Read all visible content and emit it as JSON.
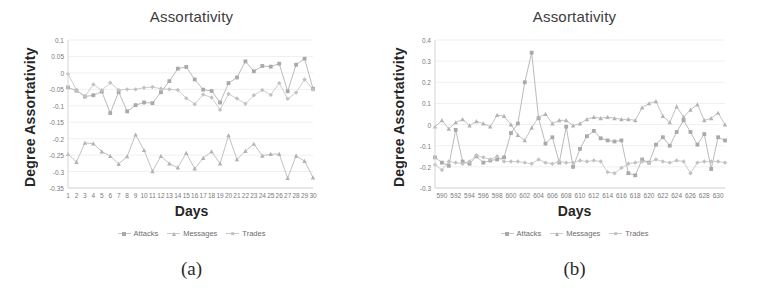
{
  "figure": {
    "panels": [
      {
        "caption": "(a)",
        "title": "Assortativity",
        "xlabel": "Days",
        "ylabel": "Degree Assortativity",
        "legend": [
          {
            "label": "Attacks",
            "marker": "square",
            "color": "#a9a9a9"
          },
          {
            "label": "Messages",
            "marker": "triangle",
            "color": "#b3b3b3"
          },
          {
            "label": "Trades",
            "marker": "diamond",
            "color": "#c2c2c2"
          }
        ]
      },
      {
        "caption": "(b)",
        "title": "Assortativity",
        "xlabel": "Days",
        "ylabel": "Degree Assortativity",
        "legend": [
          {
            "label": "Attacks",
            "marker": "square",
            "color": "#a9a9a9"
          },
          {
            "label": "Messages",
            "marker": "triangle",
            "color": "#b3b3b3"
          },
          {
            "label": "Trades",
            "marker": "diamond",
            "color": "#c2c2c2"
          }
        ]
      }
    ]
  },
  "chart_data": [
    {
      "type": "line",
      "panel": "(a)",
      "title": "Assortativity",
      "xlabel": "Days",
      "ylabel": "Degree Assortativity",
      "grid": true,
      "legend_position": "bottom",
      "xlim": [
        1,
        30
      ],
      "ylim": [
        -0.35,
        0.1
      ],
      "yticks": [
        0.1,
        0.05,
        0,
        -0.05,
        -0.1,
        -0.15,
        -0.2,
        -0.25,
        -0.3,
        -0.35
      ],
      "ytick_labels": [
        "0.1",
        "0.05",
        "0",
        "-0.05",
        "-0.1",
        "-0.15",
        "-0.2",
        "-0.25",
        "-0.3",
        "-0.35"
      ],
      "x": [
        1,
        2,
        3,
        4,
        5,
        6,
        7,
        8,
        9,
        10,
        11,
        12,
        13,
        14,
        15,
        16,
        17,
        18,
        19,
        20,
        21,
        22,
        23,
        24,
        25,
        26,
        27,
        28,
        29,
        30
      ],
      "xtick_labels": [
        "1",
        "2",
        "3",
        "4",
        "5",
        "6",
        "7",
        "8",
        "9",
        "10",
        "11",
        "12",
        "13",
        "14",
        "15",
        "16",
        "17",
        "18",
        "19",
        "20",
        "21",
        "22",
        "23",
        "24",
        "25",
        "26",
        "27",
        "28",
        "29",
        "30"
      ],
      "series": [
        {
          "name": "Attacks",
          "marker": "square",
          "color": "#a9a9a9",
          "values": [
            -0.044,
            -0.054,
            -0.072,
            -0.068,
            -0.057,
            -0.122,
            -0.058,
            -0.117,
            -0.098,
            -0.09,
            -0.092,
            -0.059,
            -0.025,
            0.013,
            0.018,
            -0.02,
            -0.051,
            -0.055,
            -0.09,
            -0.031,
            -0.014,
            0.035,
            0.005,
            0.021,
            0.019,
            0.028,
            -0.056,
            0.025,
            0.043,
            -0.048
          ]
        },
        {
          "name": "Messages",
          "marker": "triangle",
          "color": "#b3b3b3",
          "values": [
            -0.247,
            -0.271,
            -0.213,
            -0.215,
            -0.239,
            -0.253,
            -0.277,
            -0.254,
            -0.188,
            -0.235,
            -0.299,
            -0.253,
            -0.276,
            -0.288,
            -0.244,
            -0.291,
            -0.259,
            -0.239,
            -0.276,
            -0.19,
            -0.263,
            -0.238,
            -0.216,
            -0.252,
            -0.247,
            -0.247,
            -0.32,
            -0.252,
            -0.268,
            -0.318
          ]
        },
        {
          "name": "Trades",
          "marker": "diamond",
          "color": "#c2c2c2",
          "values": [
            -0.003,
            -0.052,
            -0.072,
            -0.035,
            -0.053,
            -0.03,
            -0.052,
            -0.05,
            -0.05,
            -0.045,
            -0.043,
            -0.048,
            -0.05,
            -0.052,
            -0.077,
            -0.095,
            -0.066,
            -0.075,
            -0.112,
            -0.064,
            -0.078,
            -0.094,
            -0.068,
            -0.052,
            -0.067,
            -0.031,
            -0.079,
            -0.06,
            -0.02,
            -0.051
          ]
        }
      ]
    },
    {
      "type": "line",
      "panel": "(b)",
      "title": "Assortativity",
      "xlabel": "Days",
      "ylabel": "Degree Assortativity",
      "grid": true,
      "legend_position": "bottom",
      "xlim": [
        589,
        631
      ],
      "ylim": [
        -0.3,
        0.4
      ],
      "yticks": [
        0.4,
        0.3,
        0.2,
        0.1,
        0,
        -0.1,
        -0.2,
        -0.3
      ],
      "ytick_labels": [
        "0.4",
        "0.3",
        "0.2",
        "0.1",
        "0",
        "-0.1",
        "-0.2",
        "-0.3"
      ],
      "x": [
        589,
        590,
        591,
        592,
        593,
        594,
        595,
        596,
        597,
        598,
        599,
        600,
        601,
        602,
        603,
        604,
        605,
        606,
        607,
        608,
        609,
        610,
        611,
        612,
        613,
        614,
        615,
        616,
        617,
        618,
        619,
        620,
        621,
        622,
        623,
        624,
        625,
        626,
        627,
        628,
        629,
        630,
        631
      ],
      "xtick_labels": [
        "590",
        "592",
        "594",
        "596",
        "598",
        "600",
        "602",
        "604",
        "606",
        "608",
        "610",
        "612",
        "614",
        "616",
        "618",
        "620",
        "622",
        "624",
        "626",
        "628",
        "630"
      ],
      "xtick_values": [
        590,
        592,
        594,
        596,
        598,
        600,
        602,
        604,
        606,
        608,
        610,
        612,
        614,
        616,
        618,
        620,
        622,
        624,
        626,
        628,
        630
      ],
      "series": [
        {
          "name": "Attacks",
          "marker": "square",
          "color": "#a9a9a9",
          "values": [
            -0.155,
            -0.18,
            -0.195,
            -0.025,
            -0.175,
            -0.185,
            -0.15,
            -0.18,
            -0.17,
            -0.165,
            -0.155,
            -0.04,
            0.005,
            0.2,
            0.34,
            0.03,
            -0.09,
            -0.06,
            -0.18,
            -0.01,
            -0.2,
            -0.115,
            -0.055,
            -0.03,
            -0.065,
            -0.075,
            -0.08,
            -0.075,
            -0.23,
            -0.24,
            -0.165,
            -0.18,
            -0.095,
            -0.06,
            -0.1,
            -0.035,
            0.02,
            -0.035,
            -0.095,
            -0.045,
            -0.21,
            -0.06,
            -0.075
          ]
        },
        {
          "name": "Messages",
          "marker": "triangle",
          "color": "#b3b3b3",
          "values": [
            -0.01,
            0.02,
            -0.02,
            0.01,
            0.025,
            -0.005,
            0.015,
            0.005,
            -0.01,
            0.045,
            0.04,
            0.0,
            -0.05,
            -0.075,
            -0.015,
            0.035,
            0.05,
            0.005,
            0.02,
            0.02,
            -0.005,
            0.005,
            0.025,
            0.035,
            0.03,
            0.035,
            0.03,
            0.025,
            0.025,
            0.02,
            0.08,
            0.1,
            0.11,
            0.04,
            0.01,
            0.085,
            0.035,
            0.07,
            0.095,
            0.02,
            0.03,
            0.055,
            0.0
          ]
        },
        {
          "name": "Trades",
          "marker": "diamond",
          "color": "#c2c2c2",
          "values": [
            -0.19,
            -0.215,
            -0.175,
            -0.18,
            -0.185,
            -0.175,
            -0.145,
            -0.155,
            -0.165,
            -0.15,
            -0.175,
            -0.175,
            -0.175,
            -0.18,
            -0.185,
            -0.165,
            -0.18,
            -0.185,
            -0.175,
            -0.18,
            -0.18,
            -0.17,
            -0.175,
            -0.17,
            -0.175,
            -0.225,
            -0.23,
            -0.205,
            -0.185,
            -0.18,
            -0.175,
            -0.18,
            -0.165,
            -0.175,
            -0.18,
            -0.17,
            -0.175,
            -0.23,
            -0.18,
            -0.175,
            -0.175,
            -0.175,
            -0.18
          ]
        }
      ]
    }
  ]
}
